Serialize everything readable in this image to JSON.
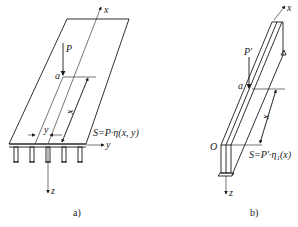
{
  "figure_a": {
    "caption": "a)",
    "labels": {
      "x_axis": "x",
      "y_axis": "y",
      "z_axis": "z",
      "load": "P",
      "point": "a",
      "dim_x": "x",
      "dim_y": "y",
      "formula": "S=P·η(x, y)"
    }
  },
  "figure_b": {
    "caption": "b)",
    "labels": {
      "x_axis": "x",
      "z_axis": "z",
      "load": "P′",
      "point": "a",
      "origin": "O",
      "dim_x": "x",
      "formula": "S=P′·η₁(x)"
    }
  }
}
